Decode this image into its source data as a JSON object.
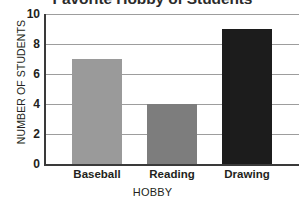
{
  "chart_data": {
    "type": "bar",
    "title": "Favorite Hobby of Students",
    "xlabel": "HOBBY",
    "ylabel": "NUMBER OF STUDENTS",
    "categories": [
      "Baseball",
      "Reading",
      "Drawing"
    ],
    "values": [
      7,
      4,
      9
    ],
    "series": [
      {
        "name": "Number of Students",
        "values": [
          7,
          4,
          9
        ]
      }
    ],
    "bar_colors": [
      "#9a9a9a",
      "#7d7d7d",
      "#1c1c1c"
    ],
    "ylim": [
      0,
      10
    ],
    "y_ticks": [
      0,
      2,
      4,
      6,
      8,
      10
    ],
    "y_tick_labels": [
      "0",
      "2",
      "4",
      "6",
      "8",
      "10"
    ],
    "grid": true,
    "grid_axis": "y",
    "legend": false,
    "legend_position": "none",
    "axis_color": "#3a3a3a",
    "gridline_color": "#9d9d9d",
    "background_color": "#ffffff",
    "text_color": "#231f20",
    "title_clipped_at_top": true
  }
}
